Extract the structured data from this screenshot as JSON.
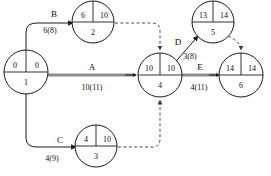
{
  "diagram": {
    "type": "activity-on-arrow-network",
    "colors": {
      "stroke": "#1a1a1a",
      "critical_path": "#8d8d8d",
      "dashed": "#4a4a4a",
      "background": "#ffffff"
    },
    "nodes": [
      {
        "id": "1",
        "early": "0",
        "late": "0",
        "cx": 26,
        "cy": 72
      },
      {
        "id": "2",
        "early": "6",
        "late": "10",
        "cx": 93,
        "cy": 22
      },
      {
        "id": "3",
        "early": "4",
        "late": "10",
        "cx": 96,
        "cy": 146
      },
      {
        "id": "4",
        "early": "10",
        "late": "10",
        "cx": 160,
        "cy": 75
      },
      {
        "id": "5",
        "early": "13",
        "late": "14",
        "cx": 213,
        "cy": 22
      },
      {
        "id": "6",
        "early": "14",
        "late": "14",
        "cx": 241,
        "cy": 75
      }
    ],
    "activities": [
      {
        "name": "A",
        "duration": "10(11)",
        "from": "1",
        "to": "4",
        "critical": true
      },
      {
        "name": "B",
        "duration": "6(8)",
        "from": "1",
        "to": "2",
        "critical": false
      },
      {
        "name": "C",
        "duration": "4(9)",
        "from": "1",
        "to": "3",
        "critical": false
      },
      {
        "name": "D",
        "duration": "3(8)",
        "from": "4",
        "to": "5",
        "critical": false
      },
      {
        "name": "E",
        "duration": "4(11)",
        "from": "4",
        "to": "6",
        "critical": true
      }
    ],
    "dummy_activities": [
      {
        "from": "2",
        "to": "4"
      },
      {
        "from": "3",
        "to": "4"
      },
      {
        "from": "5",
        "to": "6"
      }
    ]
  }
}
